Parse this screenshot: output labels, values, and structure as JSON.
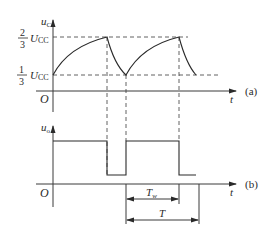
{
  "figure": {
    "panel_a": {
      "y_axis_label_main": "u",
      "y_axis_label_sub": "C",
      "x_axis_label": "t",
      "panel_label": "(a)",
      "origin_label": "O",
      "level_high": {
        "num": "2",
        "den": "3",
        "symbol": "U",
        "sub": "CC"
      },
      "level_low": {
        "num": "1",
        "den": "3",
        "symbol": "U",
        "sub": "CC"
      },
      "description": "Capacitor voltage charging from 1/3 Ucc to 2/3 Ucc and discharging back to 1/3 Ucc"
    },
    "panel_b": {
      "y_axis_label_main": "u",
      "y_axis_label_sub": "o",
      "x_axis_label": "t",
      "panel_label": "(b)",
      "origin_label": "O",
      "dim_width_main": "T",
      "dim_width_sub": "w",
      "dim_period": "T",
      "description": "Output rectangular pulse: high while capacitor charges, low while it discharges"
    }
  }
}
